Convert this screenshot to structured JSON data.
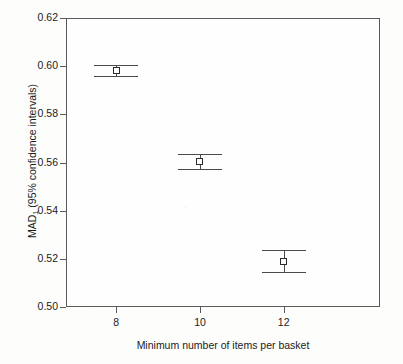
{
  "chart_data": {
    "type": "scatter",
    "title": "",
    "subtitle": "",
    "xlabel": "Minimum number of items per basket",
    "ylabel": "MAD₁ (95% confidence intervals)",
    "ylabel_main": "MAD",
    "ylabel_sub": "1",
    "ylabel_rest": " (95% confidence intervals)",
    "x": [
      8,
      10,
      12
    ],
    "xtick_labels": [
      "8",
      "10",
      "12"
    ],
    "ytick_labels": [
      "0.62",
      "0.60",
      "0.58",
      "0.56",
      "0.54",
      "0.52",
      "0.50"
    ],
    "ytick_values": [
      0.62,
      0.6,
      0.58,
      0.56,
      0.54,
      0.52,
      0.5
    ],
    "xlim": [
      6.8,
      14.3
    ],
    "ylim": [
      0.5,
      0.62
    ],
    "grid": false,
    "legend": null,
    "series": [
      {
        "name": "MAD₁ mean with 95% CI",
        "marker": "open-square",
        "values": [
          0.5983,
          0.5606,
          0.5187
        ],
        "ci_lower": [
          0.5961,
          0.5573,
          0.5145
        ],
        "ci_upper": [
          0.6003,
          0.5635,
          0.5237
        ]
      }
    ],
    "points": [
      {
        "x": 8,
        "xtick_label": "8",
        "value": 0.5983,
        "ci_lower": 0.5961,
        "ci_upper": 0.6003
      },
      {
        "x": 10,
        "xtick_label": "10",
        "value": 0.5606,
        "ci_lower": 0.5573,
        "ci_upper": 0.5635
      },
      {
        "x": 12,
        "xtick_label": "12",
        "value": 0.5187,
        "ci_lower": 0.5145,
        "ci_upper": 0.5237
      }
    ],
    "colors": {
      "axis": "#5a5a5a",
      "marker_edge": "#2b2b2b",
      "marker_fill": "#fefefe",
      "errorbar": "#4a4a4a",
      "text": "#1b1b1b",
      "background": "#fdfdfc"
    }
  }
}
